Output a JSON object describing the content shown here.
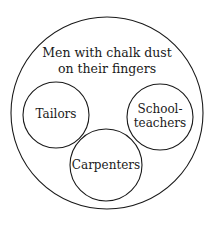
{
  "diagram": {
    "type": "euler-diagram",
    "outer_set": {
      "label_lines": [
        "Men with chalk dust",
        "on their fingers"
      ]
    },
    "inner_sets": [
      {
        "id": "tailors",
        "label_lines": [
          "Tailors"
        ]
      },
      {
        "id": "schoolteachers",
        "label_lines": [
          "School-",
          "teachers"
        ]
      },
      {
        "id": "carpenters",
        "label_lines": [
          "Carpenters"
        ]
      }
    ]
  },
  "colors": {
    "stroke": "#1a1a1a",
    "background": "#ffffff"
  }
}
